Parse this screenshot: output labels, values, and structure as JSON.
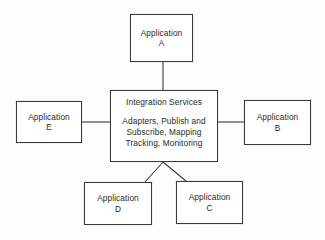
{
  "diagram": {
    "type": "hub-and-spoke",
    "background_color": "#fdfdfd",
    "stroke_color": "#3a3a3a",
    "text_color": "#2b2b2b",
    "hub": {
      "title": "Integration Services",
      "detail_lines": [
        "Adapters, Publish and",
        "Subscribe, Mapping",
        "Tracking, Monitoring"
      ]
    },
    "nodes": [
      {
        "id": "app-a",
        "line1": "Application",
        "line2": "A",
        "position": "top"
      },
      {
        "id": "app-b",
        "line1": "Application",
        "line2": "B",
        "position": "right"
      },
      {
        "id": "app-c",
        "line1": "Application",
        "line2": "C",
        "position": "bottom-right"
      },
      {
        "id": "app-d",
        "line1": "Application",
        "line2": "D",
        "position": "bottom-left"
      },
      {
        "id": "app-e",
        "line1": "Application",
        "line2": "E",
        "position": "left"
      }
    ],
    "connectors": [
      {
        "id": "hub-to-app-a",
        "from": "hub",
        "to": "app-a",
        "shape": "vertical"
      },
      {
        "id": "hub-to-app-e",
        "from": "hub",
        "to": "app-e",
        "shape": "horizontal"
      },
      {
        "id": "hub-to-app-b",
        "from": "hub",
        "to": "app-b",
        "shape": "horizontal"
      },
      {
        "id": "hub-to-app-d",
        "from": "hub",
        "to": "app-d",
        "shape": "diagonal"
      },
      {
        "id": "hub-to-app-c",
        "from": "hub",
        "to": "app-c",
        "shape": "diagonal"
      }
    ]
  }
}
